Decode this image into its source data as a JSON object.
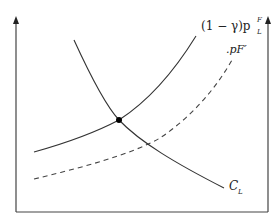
{
  "diagram": {
    "type": "economics-curves",
    "curves": [
      {
        "id": "supply_foreign",
        "label": "(1 − γ)p",
        "label_sup": "F",
        "label_sub": "L",
        "style": "solid"
      },
      {
        "id": "price_foreign_prime",
        "label": ".pF′",
        "style": "dashed"
      },
      {
        "id": "cost_L",
        "label": "C",
        "label_sub": "L",
        "style": "solid"
      }
    ],
    "intersection": {
      "label": "",
      "marker": "filled-dot"
    },
    "axes": {
      "left": "vertical-arrow",
      "right": "vertical-arrow",
      "bottom": "horizontal-line"
    },
    "colors": {
      "line": "#333333",
      "dot": "#000000"
    }
  },
  "labels": {
    "curve1_main": "(1 − γ)p",
    "curve1_sup": "F",
    "curve1_sub": "L",
    "curve2": ".pF′",
    "curve3_main": "C",
    "curve3_sub": "L"
  }
}
